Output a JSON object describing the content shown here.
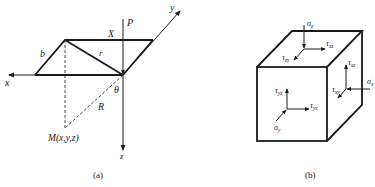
{
  "figure_a": {
    "caption": "(a)",
    "axes": {
      "x": "x",
      "y": "y",
      "z": "z"
    },
    "labels": {
      "force": "P",
      "X": "X",
      "b": "b",
      "r": "r",
      "theta": "θ",
      "R": "R",
      "point": "M(x,y,z)"
    }
  },
  "figure_b": {
    "caption": "(b)",
    "stress_labels": {
      "sigma_z": "σz",
      "tau_xz_top": "τxz",
      "tau_zy": "τzy",
      "tau_xz_right": "τxz",
      "sigma_x": "σx",
      "tau_xy": "τxy",
      "tau_yz": "τyz",
      "tau_yx": "τyx",
      "sigma_y": "σy"
    }
  }
}
